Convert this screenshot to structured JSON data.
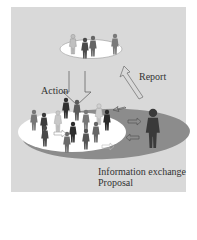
{
  "diagram": {
    "labels": {
      "action": "Action",
      "report": "Report",
      "info_exchange": "Information exchange",
      "proposal": "Proposal"
    },
    "colors": {
      "panel": "#d9d9d9",
      "top_ellipse": "#ffffff",
      "bottom_inner_ellipse": "#ffffff",
      "bottom_outer_ellipse": "#8c8c8c",
      "figure_dark": "#3a3a3a",
      "figure_mid": "#6e6e6e",
      "figure_light": "#b5b5b5",
      "text": "#333333"
    },
    "nodes": [
      {
        "id": "top-group",
        "shape": "ellipse",
        "figures": 4
      },
      {
        "id": "bottom-community",
        "shape": "ellipse",
        "figures": 14
      },
      {
        "id": "outer-ring",
        "shape": "ellipse"
      },
      {
        "id": "large-figure",
        "shape": "person"
      }
    ],
    "edges": [
      {
        "from": "top-group",
        "to": "bottom-community",
        "label": "Action"
      },
      {
        "from": "bottom-community",
        "to": "top-group",
        "label": "Report"
      },
      {
        "from": "large-figure",
        "to": "bottom-community",
        "label": "Information exchange / Proposal"
      }
    ]
  }
}
